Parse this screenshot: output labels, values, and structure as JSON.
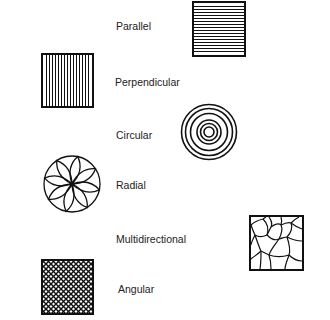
{
  "diagram": {
    "items": [
      {
        "label": "Parallel",
        "pattern": "parallel-lines-icon"
      },
      {
        "label": "Perpendicular",
        "pattern": "perpendicular-lines-icon"
      },
      {
        "label": "Circular",
        "pattern": "concentric-circles-icon"
      },
      {
        "label": "Radial",
        "pattern": "radial-petals-icon"
      },
      {
        "label": "Multidirectional",
        "pattern": "irregular-cells-icon"
      },
      {
        "label": "Angular",
        "pattern": "crosshatch-icon"
      }
    ],
    "colors": {
      "ink": "#111111",
      "background": "#ffffff",
      "text": "#222222"
    }
  }
}
